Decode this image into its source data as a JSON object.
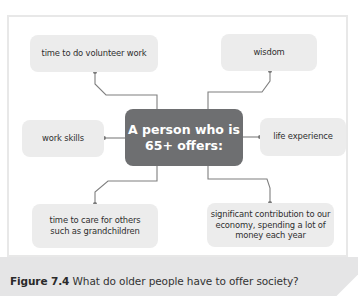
{
  "diagram": {
    "center": {
      "line1": "A person who is",
      "line2": "65+ offers:"
    },
    "nodes": [
      {
        "id": "volunteer",
        "lines": [
          "time to do volunteer work"
        ]
      },
      {
        "id": "wisdom",
        "lines": [
          "wisdom"
        ]
      },
      {
        "id": "work-skills",
        "lines": [
          "work skills"
        ]
      },
      {
        "id": "life-experience",
        "lines": [
          "life experience"
        ]
      },
      {
        "id": "care",
        "lines": [
          "time to care for others",
          "such as grandchildren"
        ]
      },
      {
        "id": "economy",
        "lines": [
          "significant contribution to our",
          "economy, spending a lot of",
          "money each year"
        ]
      }
    ]
  },
  "caption": {
    "label": "Figure 7.4",
    "text": " What do older people have to offer society?"
  },
  "colors": {
    "center_fill": "#6e6f71",
    "node_fill": "#ececec",
    "connector": "#7a7a7a",
    "caption_band": "#e5e5e6"
  }
}
